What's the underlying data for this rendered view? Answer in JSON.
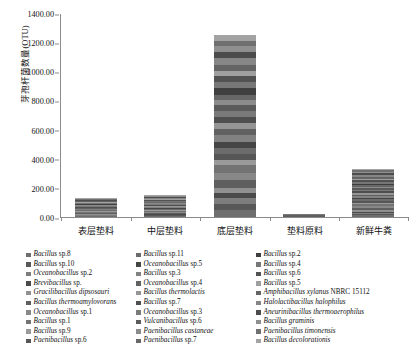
{
  "chart_data": {
    "type": "bar",
    "subtype": "stacked-bar",
    "title": "",
    "xlabel": "",
    "ylabel": "芽孢杆菌数量(OTU)",
    "ylim": [
      0,
      1400
    ],
    "ytick_step": 200,
    "ytick_labels": [
      "1400.00",
      "1200.00",
      "1000.00",
      "800.00",
      "600.00",
      "400.00",
      "200.00",
      "0.00"
    ],
    "ytick_values": [
      1400,
      1200,
      1000,
      800,
      600,
      400,
      200,
      0
    ],
    "grid": false,
    "legend_position": "bottom",
    "categories": [
      "表层垫料",
      "中层垫料",
      "底层垫料",
      "垫料原料",
      "新鲜牛粪"
    ],
    "totals": [
      130,
      152,
      1253,
      25,
      332
    ],
    "series": [
      {
        "name": "Bacillus sp.8",
        "color": "#6e6e6e",
        "values": [
          4,
          6,
          50,
          1,
          10
        ]
      },
      {
        "name": "Bacillus sp.10",
        "color": "#585858",
        "values": [
          3,
          5,
          42,
          1,
          8
        ]
      },
      {
        "name": "Oceanobacillus sp.2",
        "color": "#7d7d7d",
        "values": [
          5,
          4,
          38,
          1,
          9
        ]
      },
      {
        "name": "Brevibacillus sp.",
        "color": "#4a4a4a",
        "values": [
          3,
          5,
          35,
          0,
          7
        ]
      },
      {
        "name": "Gracilibacillus dipsosauri",
        "color": "#909090",
        "values": [
          4,
          4,
          40,
          1,
          12
        ]
      },
      {
        "name": "Bacillus thermoamylovorans",
        "color": "#5f5f5f",
        "values": [
          6,
          7,
          55,
          1,
          14
        ]
      },
      {
        "name": "Oceanobacillus sp.1",
        "color": "#888888",
        "values": [
          4,
          5,
          44,
          1,
          11
        ]
      },
      {
        "name": "Bacillus sp.1",
        "color": "#737373",
        "values": [
          6,
          8,
          60,
          1,
          13
        ]
      },
      {
        "name": "Bacillus sp.9",
        "color": "#9a9a9a",
        "values": [
          3,
          4,
          36,
          1,
          9
        ]
      },
      {
        "name": "Paenibacillus sp.6",
        "color": "#565656",
        "values": [
          4,
          5,
          38,
          1,
          10
        ]
      },
      {
        "name": "Bacillus sp.11",
        "color": "#6b6b6b",
        "values": [
          5,
          6,
          45,
          1,
          11
        ]
      },
      {
        "name": "Oceanobacillus sp.5",
        "color": "#454545",
        "values": [
          4,
          5,
          40,
          1,
          9
        ]
      },
      {
        "name": "Bacillus sp.3",
        "color": "#828282",
        "values": [
          5,
          6,
          48,
          1,
          12
        ]
      },
      {
        "name": "Oceanobacillus sp.4",
        "color": "#616161",
        "values": [
          4,
          5,
          42,
          1,
          10
        ]
      },
      {
        "name": "Bacillus thermolactis",
        "color": "#959595",
        "values": [
          4,
          5,
          40,
          1,
          11
        ]
      },
      {
        "name": "Bacillus sp.7",
        "color": "#4f4f4f",
        "values": [
          5,
          6,
          46,
          1,
          10
        ]
      },
      {
        "name": "Oceanobacillus sp.3",
        "color": "#7a7a7a",
        "values": [
          4,
          5,
          41,
          1,
          9
        ]
      },
      {
        "name": "Vulcanibacillus sp.6",
        "color": "#5b5b5b",
        "values": [
          4,
          5,
          38,
          1,
          10
        ]
      },
      {
        "name": "Paenibacillus castaneae",
        "color": "#8c8c8c",
        "values": [
          4,
          5,
          39,
          1,
          11
        ]
      },
      {
        "name": "Paenibacillus sp.7",
        "color": "#676767",
        "values": [
          4,
          5,
          37,
          1,
          9
        ]
      },
      {
        "name": "Bacillus sp.2",
        "color": "#3f3f3f",
        "values": [
          5,
          6,
          44,
          1,
          11
        ]
      },
      {
        "name": "Bacillus sp.4",
        "color": "#777777",
        "values": [
          4,
          5,
          40,
          1,
          10
        ]
      },
      {
        "name": "Bacillus sp.6",
        "color": "#525252",
        "values": [
          5,
          6,
          45,
          1,
          12
        ]
      },
      {
        "name": "Bacillus sp.5",
        "color": "#9f9f9f",
        "values": [
          4,
          5,
          38,
          1,
          10
        ]
      },
      {
        "name": "Amphibacillus xylanus NBRC 15112",
        "color": "#646464",
        "values": [
          4,
          5,
          42,
          1,
          11
        ]
      },
      {
        "name": "Halolactibacillus halophilus",
        "color": "#868686",
        "values": [
          5,
          6,
          46,
          1,
          13
        ]
      },
      {
        "name": "Aneurinibacillus thermoaerophilus",
        "color": "#4c4c4c",
        "values": [
          4,
          5,
          40,
          1,
          10
        ]
      },
      {
        "name": "Bacillus graminis",
        "color": "#8f8f8f",
        "values": [
          4,
          5,
          41,
          1,
          11
        ]
      },
      {
        "name": "Paenibacillus timonensis",
        "color": "#707070",
        "values": [
          4,
          5,
          39,
          1,
          10
        ]
      },
      {
        "name": "Bacillus decolorationis",
        "color": "#a3a3a3",
        "values": [
          4,
          5,
          42,
          0,
          9
        ]
      }
    ],
    "legend_columns": [
      [
        "Bacillus sp.8",
        "Bacillus sp.10",
        "Oceanobacillus sp.2",
        "Brevibacillus sp.",
        "Gracilibacillus dipsosauri",
        "Bacillus thermoamylovorans",
        "Oceanobacillus sp.1",
        "Bacillus sp.1",
        "Bacillus sp.9",
        "Paenibacillus sp.6"
      ],
      [
        "Bacillus sp.11",
        "Oceanobacillus sp.5",
        "Bacillus sp.3",
        "Oceanobacillus sp.4",
        "Bacillus thermolactis",
        "Bacillus sp.7",
        "Oceanobacillus sp.3",
        "Vulcanibacillus sp.6",
        "Paenibacillus castaneae",
        "Paenibacillus sp.7"
      ],
      [
        "Bacillus sp.2",
        "Bacillus sp.4",
        "Bacillus sp.6",
        "Bacillus sp.5",
        "Amphibacillus xylanus NBRC 15112",
        "Halolactibacillus halophilus",
        "Aneurinibacillus thermoaerophilus",
        "Bacillus graminis",
        "Paenibacillus timonensis",
        "Bacillus decolorationis"
      ]
    ]
  }
}
